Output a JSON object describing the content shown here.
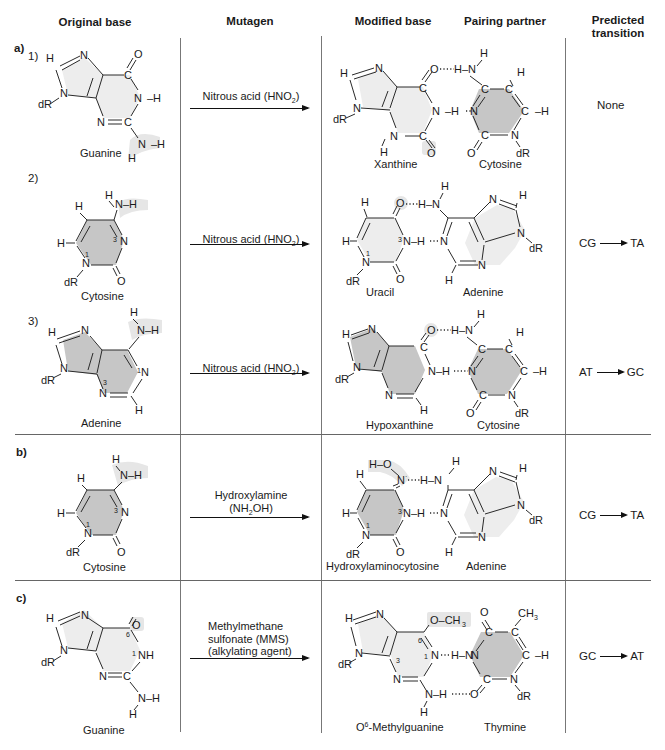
{
  "headers": {
    "original_base": "Original base",
    "mutagen": "Mutagen",
    "modified_base": "Modified base",
    "pairing_partner": "Pairing partner",
    "predicted_transition_1": "Predicted",
    "predicted_transition_2": "transition"
  },
  "sections": [
    {
      "label": "a)",
      "rows": [
        {
          "number": "1)",
          "original_base": "Guanine",
          "mutagen": "Nitrous acid (HNO",
          "mutagen_sub": "2",
          "mutagen_tail": ")",
          "modified_base": "Xanthine",
          "pairing_partner": "Cytosine",
          "transition": "None"
        },
        {
          "number": "2)",
          "original_base": "Cytosine",
          "mutagen": "Nitrous acid (HNO",
          "mutagen_sub": "2",
          "mutagen_tail": ")",
          "modified_base": "Uracil",
          "pairing_partner": "Adenine",
          "transition_from": "CG",
          "transition_to": "TA"
        },
        {
          "number": "3)",
          "original_base": "Adenine",
          "mutagen": "Nitrous acid (HNO",
          "mutagen_sub": "2",
          "mutagen_tail": ")",
          "modified_base": "Hypoxanthine",
          "pairing_partner": "Cytosine",
          "transition_from": "AT",
          "transition_to": "GC"
        }
      ]
    },
    {
      "label": "b)",
      "rows": [
        {
          "original_base": "Cytosine",
          "mutagen_line1": "Hydroxylamine",
          "mutagen_line2_a": "(NH",
          "mutagen_line2_sub": "2",
          "mutagen_line2_b": "OH)",
          "modified_base": "Hydroxylaminocytosine",
          "pairing_partner": "Adenine",
          "transition_from": "CG",
          "transition_to": "TA"
        }
      ]
    },
    {
      "label": "c)",
      "rows": [
        {
          "original_base": "Guanine",
          "mutagen_line1": "Methylmethane",
          "mutagen_line2": "sulfonate (MMS)",
          "mutagen_line3": "(alkylating agent)",
          "modified_base_prefix": "O",
          "modified_base_sup": "6",
          "modified_base_rest": "-Methylguanine",
          "pairing_partner": "Thymine",
          "transition_from": "GC",
          "transition_to": "AT"
        }
      ]
    }
  ],
  "atoms": {
    "N": "N",
    "H": "H",
    "C": "C",
    "O": "O",
    "dR": "dR",
    "NH": "NH",
    "CH3": "CH",
    "sub3": "3",
    "n1": "1",
    "n3": "3",
    "n6": "6"
  },
  "colors": {
    "purine_fill": "#ededed",
    "pyrimidine_fill": "#c6c6c6",
    "highlight": "#e6e6e6",
    "rule": "#666666"
  }
}
